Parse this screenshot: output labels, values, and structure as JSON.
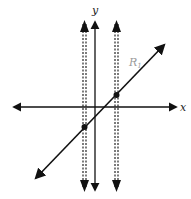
{
  "diagram": {
    "type": "coordinate-plane",
    "axes": {
      "x_label": "x",
      "y_label": "y"
    },
    "line": {
      "label": "R",
      "label_subscript": "1",
      "color": "#111111",
      "label_color": "#9a9a9a"
    },
    "vertical_dashed_lines": 2,
    "intersection_points": 2,
    "colors": {
      "stroke": "#111111",
      "background": "#ffffff"
    }
  }
}
